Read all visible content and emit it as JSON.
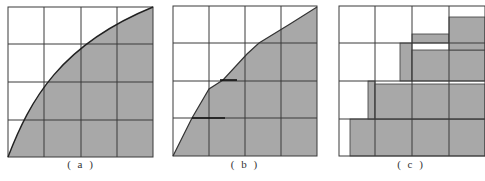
{
  "figure": {
    "panels": [
      {
        "id": "a",
        "label": "( a )",
        "description": "4x4 grid with area under a smooth concave curve shaded"
      },
      {
        "id": "b",
        "label": "( b )",
        "description": "4x4 grid with area under a piecewise-linear approximation of the curve shaded"
      },
      {
        "id": "c",
        "label": "( c )",
        "description": "4x4 grid with area approximated by stepped rectangles (staircase) shaded"
      }
    ],
    "grid": {
      "rows": 4,
      "cols": 4
    },
    "colors": {
      "shade": "#a8a8a8",
      "grid_line": "#3a3a3a",
      "curve": "#222222",
      "background": "#ffffff"
    }
  }
}
